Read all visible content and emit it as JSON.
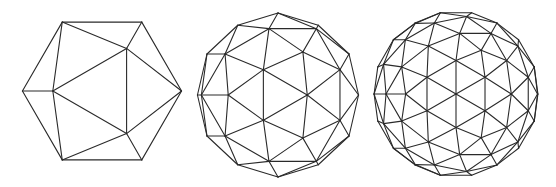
{
  "figure": {
    "line_color": "#2a2a2a",
    "background": "#ffffff"
  },
  "spheres": [
    {
      "name": "icosahedron",
      "frequency": 1,
      "center": [
        102,
        91
      ],
      "radius": 81
    },
    {
      "name": "geodesic-frequency-2",
      "frequency": 2,
      "center": [
        278,
        95
      ],
      "radius": 82
    },
    {
      "name": "geodesic-frequency-3",
      "frequency": 3,
      "center": [
        456,
        94
      ],
      "radius": 83
    }
  ]
}
